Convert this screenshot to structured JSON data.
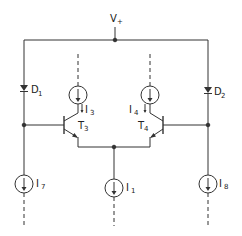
{
  "diagram": {
    "type": "circuit-schematic",
    "supply": {
      "label": "V",
      "sub": "+"
    },
    "diodes": [
      {
        "id": "D1",
        "label": "D",
        "sub": "1"
      },
      {
        "id": "D2",
        "label": "D",
        "sub": "2"
      }
    ],
    "transistors": [
      {
        "id": "T3",
        "label": "T",
        "sub": "3"
      },
      {
        "id": "T4",
        "label": "T",
        "sub": "4"
      }
    ],
    "current_sources": [
      {
        "id": "I3",
        "label": "I",
        "sub": "3"
      },
      {
        "id": "I4",
        "label": "I",
        "sub": "4"
      },
      {
        "id": "I7",
        "label": "I",
        "sub": "7"
      },
      {
        "id": "I1",
        "label": "I",
        "sub": "1"
      },
      {
        "id": "I8",
        "label": "I",
        "sub": "8"
      }
    ],
    "colors": {
      "line": "#333333",
      "background": "#ffffff"
    }
  }
}
